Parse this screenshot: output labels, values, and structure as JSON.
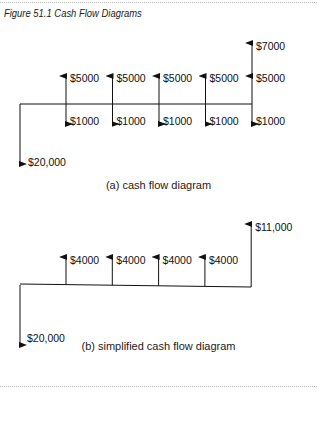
{
  "figure": {
    "title": "Figure 51.1  Cash Flow Diagrams"
  },
  "diagram_a": {
    "caption": "(a) cash flow diagram",
    "initial": {
      "label": "$20,000",
      "direction": "down"
    },
    "periods": [
      {
        "up": "$5000",
        "down": "$1000"
      },
      {
        "up": "$5000",
        "down": "$1000"
      },
      {
        "up": "$5000",
        "down": "$1000"
      },
      {
        "up": "$5000",
        "down": "$1000"
      },
      {
        "up": "$5000",
        "down": "$1000",
        "extra_up": "$7000"
      }
    ]
  },
  "diagram_b": {
    "caption": "(b) simplified cash flow diagram",
    "initial": {
      "label": "$20,000",
      "direction": "down"
    },
    "periods": [
      {
        "up": "$4000"
      },
      {
        "up": "$4000"
      },
      {
        "up": "$4000"
      },
      {
        "up": "$4000"
      },
      {
        "up": "$11,000"
      }
    ]
  }
}
